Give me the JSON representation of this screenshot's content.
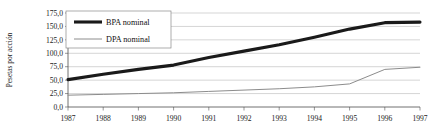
{
  "chart_data": {
    "type": "line",
    "title": "",
    "xlabel": "",
    "ylabel": "Pesetas por acción",
    "x": [
      1987,
      1988,
      1989,
      1990,
      1991,
      1992,
      1993,
      1994,
      1995,
      1996,
      1997
    ],
    "xtick_labels": [
      "1987",
      "1988",
      "1989",
      "1990",
      "1991",
      "1992",
      "1993",
      "1994",
      "1995",
      "1996",
      "1997"
    ],
    "ytick_labels": [
      "0,0",
      "25,0",
      "50,0",
      "75,0",
      "100,0",
      "125,0",
      "150,0",
      "175,0"
    ],
    "ytick_values": [
      0,
      25,
      50,
      75,
      100,
      125,
      150,
      175
    ],
    "ylim": [
      0,
      175
    ],
    "xlim": [
      1987,
      1997
    ],
    "grid": "horizontal",
    "legend_position": "top-left",
    "series": [
      {
        "name": "BPA nominal",
        "color": "#1a1a1a",
        "width": 3.1,
        "values": [
          51.0,
          61.0,
          70.0,
          78.0,
          92.0,
          104.0,
          116.0,
          130.0,
          145.0,
          157.0,
          158.0
        ]
      },
      {
        "name": "DPA nominal",
        "color": "#8c8c8c",
        "width": 1.0,
        "values": [
          22.0,
          23.5,
          25.0,
          26.5,
          29.0,
          31.5,
          34.0,
          37.5,
          43.0,
          70.0,
          74.0
        ]
      }
    ]
  },
  "legend": {
    "items": [
      {
        "label": "BPA nominal"
      },
      {
        "label": "DPA nominal"
      }
    ]
  },
  "axes": {
    "y_axis_title": "Pesetas por acción"
  },
  "colors": {
    "bpa": "#1a1a1a",
    "dpa": "#8c8c8c",
    "grid": "#b9b9b9",
    "axis": "#4d4d4d",
    "background": "#ffffff"
  }
}
